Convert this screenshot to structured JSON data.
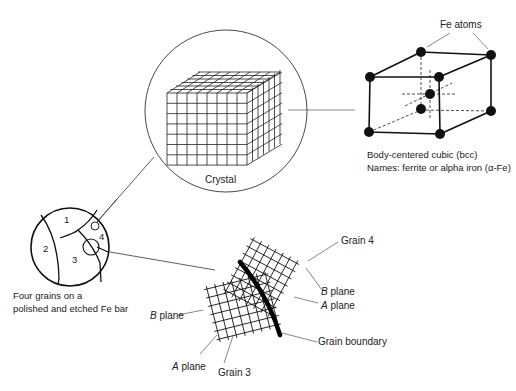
{
  "diagram": {
    "crystal": {
      "label": "Crystal"
    },
    "unit_cell": {
      "atoms_label": "Fe atoms",
      "caption_line1": "Body-centered cubic (bcc)",
      "caption_line2": "Names: ferrite or alpha iron (α-Fe)"
    },
    "grains_sample": {
      "grain_numbers": [
        "1",
        "2",
        "3",
        "4"
      ],
      "caption_line1": "Four grains on a",
      "caption_line2": "polished and etched Fe bar"
    },
    "boundary_detail": {
      "grain4_label": "Grain 4",
      "grain3_label": "Grain 3",
      "b_plane_right": {
        "letter": "B",
        "rest": " plane"
      },
      "a_plane_right": {
        "letter": "A",
        "rest": " plane"
      },
      "b_plane_left": {
        "letter": "B",
        "rest": " plane"
      },
      "a_plane_left": {
        "letter": "A",
        "rest": " plane"
      },
      "boundary_label": "Grain boundary"
    },
    "colors": {
      "ink": "#111111",
      "leader": "#555555",
      "background": "#ffffff"
    }
  }
}
